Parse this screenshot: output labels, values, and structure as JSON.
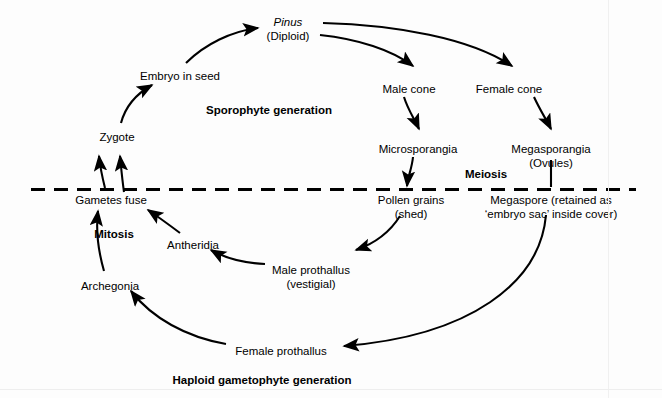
{
  "diagram": {
    "colors": {
      "ink": "#000000",
      "background": "#ffffff"
    },
    "division_line": {
      "style": "dashed",
      "label_above": "Sporophyte generation",
      "label_below": "Haploid gametophyte generation"
    },
    "nodes": [
      {
        "id": "pinus",
        "label": "Pinus",
        "sub": "(Diploid)",
        "italic": true,
        "bold": false,
        "x": 288,
        "y": 16
      },
      {
        "id": "embryo-in-seed",
        "label": "Embryo in seed",
        "sub": "",
        "italic": false,
        "bold": false,
        "x": 180,
        "y": 70
      },
      {
        "id": "male-cone",
        "label": "Male cone",
        "sub": "",
        "italic": false,
        "bold": false,
        "x": 409,
        "y": 83
      },
      {
        "id": "female-cone",
        "label": "Female cone",
        "sub": "",
        "italic": false,
        "bold": false,
        "x": 509,
        "y": 83
      },
      {
        "id": "sporophyte-gen",
        "label": "Sporophyte generation",
        "sub": "",
        "italic": false,
        "bold": true,
        "x": 269,
        "y": 104
      },
      {
        "id": "zygote",
        "label": "Zygote",
        "sub": "",
        "italic": false,
        "bold": false,
        "x": 117,
        "y": 131
      },
      {
        "id": "microsporangia",
        "label": "Microsporangia",
        "sub": "",
        "italic": false,
        "bold": false,
        "x": 418,
        "y": 143
      },
      {
        "id": "megasporangia",
        "label": "Megasporangia",
        "sub": "(Ovules)",
        "italic": false,
        "bold": false,
        "x": 551,
        "y": 143
      },
      {
        "id": "meiosis",
        "label": "Meiosis",
        "sub": "",
        "italic": false,
        "bold": true,
        "x": 486,
        "y": 168
      },
      {
        "id": "gametes-fuse",
        "label": "Gametes fuse",
        "sub": "",
        "italic": false,
        "bold": false,
        "x": 111,
        "y": 194
      },
      {
        "id": "pollen-grains",
        "label": "Pollen grains",
        "sub": "(shed)",
        "italic": false,
        "bold": false,
        "x": 411,
        "y": 194
      },
      {
        "id": "megaspore",
        "label": "Megaspore (retained as",
        "sub": "‘embryo sac’ inside cover)",
        "italic": false,
        "bold": false,
        "x": 551,
        "y": 194
      },
      {
        "id": "mitosis",
        "label": "Mitosis",
        "sub": "",
        "italic": false,
        "bold": true,
        "x": 114,
        "y": 228
      },
      {
        "id": "antheridia",
        "label": "Antheridia",
        "sub": "",
        "italic": false,
        "bold": false,
        "x": 193,
        "y": 239
      },
      {
        "id": "male-prothallus",
        "label": "Male prothallus",
        "sub": "(vestigial)",
        "italic": false,
        "bold": false,
        "x": 311,
        "y": 264
      },
      {
        "id": "archegonia",
        "label": "Archegonia",
        "sub": "",
        "italic": false,
        "bold": false,
        "x": 110,
        "y": 280
      },
      {
        "id": "female-prothallus",
        "label": "Female prothallus",
        "sub": "",
        "italic": false,
        "bold": false,
        "x": 281,
        "y": 345
      },
      {
        "id": "haploid-gen",
        "label": "Haploid gametophyte generation",
        "sub": "",
        "italic": false,
        "bold": true,
        "x": 262,
        "y": 374
      }
    ],
    "edges": [
      {
        "from": "embryo-in-seed",
        "to": "pinus",
        "shape": "curve"
      },
      {
        "from": "pinus",
        "to": "male-cone",
        "shape": "curve"
      },
      {
        "from": "pinus",
        "to": "female-cone",
        "shape": "curve"
      },
      {
        "from": "male-cone",
        "to": "microsporangia",
        "shape": "curve"
      },
      {
        "from": "female-cone",
        "to": "megasporangia",
        "shape": "curve"
      },
      {
        "from": "microsporangia",
        "to": "pollen-grains",
        "shape": "curve"
      },
      {
        "from": "megasporangia",
        "to": "megaspore",
        "shape": "line"
      },
      {
        "from": "pollen-grains",
        "to": "male-prothallus",
        "shape": "curve"
      },
      {
        "from": "male-prothallus",
        "to": "antheridia",
        "shape": "curve"
      },
      {
        "from": "antheridia",
        "to": "gametes-fuse",
        "shape": "line"
      },
      {
        "from": "megaspore",
        "to": "female-prothallus",
        "shape": "curve"
      },
      {
        "from": "female-prothallus",
        "to": "archegonia",
        "shape": "curve"
      },
      {
        "from": "archegonia",
        "to": "gametes-fuse",
        "shape": "curve"
      },
      {
        "from": "gametes-fuse",
        "to": "zygote",
        "shape": "curve"
      },
      {
        "from": "gametes-fuse",
        "to": "zygote",
        "shape": "curve"
      },
      {
        "from": "zygote",
        "to": "embryo-in-seed",
        "shape": "curve"
      }
    ]
  }
}
